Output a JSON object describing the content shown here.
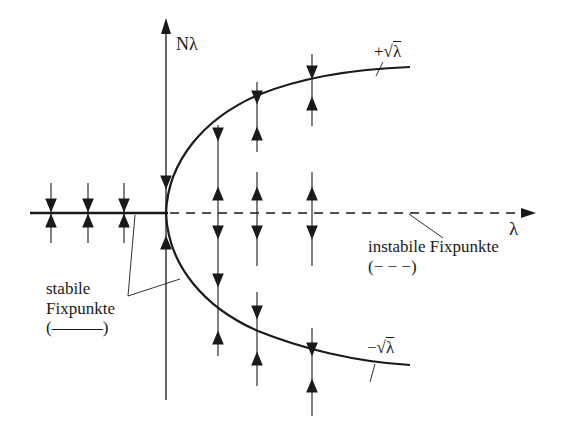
{
  "diagram": {
    "title": "",
    "type": "pitchfork-bifurcation",
    "axes": {
      "y_label": "Nλ",
      "x_label": "λ"
    },
    "branches": {
      "upper": {
        "sign": "+",
        "radical": "√",
        "var": "λ"
      },
      "lower": {
        "sign": "−",
        "radical": "√",
        "var": "λ"
      }
    },
    "annotations": {
      "stable": {
        "line1": "stabile",
        "line2": "Fixpunkte",
        "line3": "(———)"
      },
      "unstable": {
        "line1": "instabile Fixpunkte",
        "line2": "(− − −)"
      }
    },
    "colors": {
      "ink": "#1a1a1a",
      "background": "#ffffff"
    },
    "flow_columns": [
      {
        "x": "λ<0 (1)",
        "arrows": [
          "down-toward-0",
          "up-toward-0"
        ]
      },
      {
        "x": "λ<0 (2)",
        "arrows": [
          "down-toward-0",
          "up-toward-0"
        ]
      },
      {
        "x": "λ<0 (3)",
        "arrows": [
          "down-toward-0",
          "up-toward-0"
        ]
      },
      {
        "x": "λ=0",
        "arrows": [
          "down-toward-0",
          "up-toward-0"
        ]
      },
      {
        "x": "λ>0 (1)",
        "arrows": [
          "down-toward-+√λ",
          "up-away-from-0",
          "down-away-from-0",
          "down-toward-−√λ",
          "up-toward-−√λ"
        ]
      },
      {
        "x": "λ>0 (2)",
        "arrows": [
          "down-toward-+√λ",
          "up-toward-+√λ",
          "up-away-from-0",
          "down-away-from-0",
          "down-toward-−√λ",
          "up-toward-−√λ"
        ]
      },
      {
        "x": "λ>0 (3)",
        "arrows": [
          "down-toward-+√λ",
          "up-toward-+√λ",
          "up-away-from-0",
          "down-away-from-0",
          "down-toward-−√λ",
          "up-toward-−√λ"
        ]
      }
    ]
  }
}
